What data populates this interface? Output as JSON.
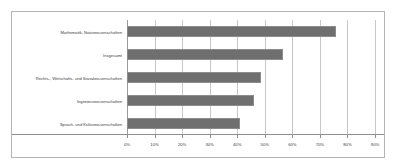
{
  "chart_data": {
    "type": "bar",
    "orientation": "horizontal",
    "title": "",
    "subtitle": "",
    "xlabel": "",
    "ylabel": "",
    "xlim": [
      0,
      90
    ],
    "grid": true,
    "legend": false,
    "bar_color": "#6f6f6f",
    "grid_color": "#c8c8c8",
    "axis_color": "#8f8f8f",
    "frame_color": "#b4b4b4",
    "background": "#ffffff",
    "tick_labels": [
      "0%",
      "10%",
      "20%",
      "30%",
      "40%",
      "50%",
      "60%",
      "70%",
      "80%",
      "90%"
    ],
    "tick_values": [
      0,
      10,
      20,
      30,
      40,
      50,
      60,
      70,
      80,
      90
    ],
    "categories": [
      "Mathematik, Naturwissenschaften",
      "Insgesamt",
      "Rechts-, Wirtschafts- und Sozialwissenschaften",
      "Ingenieurwissenschaften",
      "Sprach- und Kulturwissenschaften"
    ],
    "values": [
      76,
      56.5,
      48.5,
      46,
      41
    ]
  }
}
